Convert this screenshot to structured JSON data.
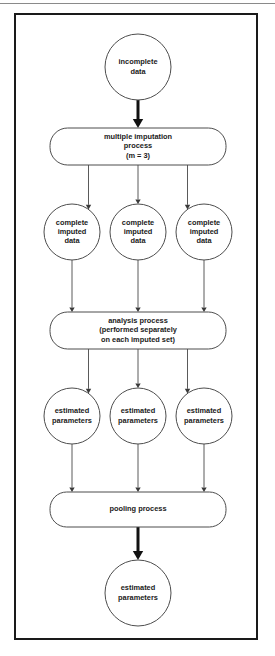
{
  "figure": {
    "frame_border_color": "#1a1a1a",
    "node_stroke_color": "#4d4d4d",
    "edge_color": "#5a5a5a",
    "emphasis_edge_color": "#111111"
  },
  "chart_data": {
    "type": "diagram",
    "title": "",
    "subtitle": "",
    "xlabel": "",
    "ylabel": "",
    "legend": [],
    "nodes": [
      {
        "id": "n1",
        "shape": "circle",
        "lines": [
          "incomplete",
          "data"
        ],
        "cx": 124,
        "cy": 54,
        "r": 33
      },
      {
        "id": "n2",
        "shape": "roundrect",
        "lines": [
          "multiple imputation",
          "process",
          "(m = 3)"
        ],
        "x": 36,
        "y": 115,
        "w": 176,
        "h": 37
      },
      {
        "id": "n3",
        "shape": "circle",
        "lines": [
          "complete",
          "imputed",
          "data"
        ],
        "cx": 58,
        "cy": 219,
        "r": 28
      },
      {
        "id": "n4",
        "shape": "circle",
        "lines": [
          "complete",
          "imputed",
          "data"
        ],
        "cx": 124,
        "cy": 219,
        "r": 28
      },
      {
        "id": "n5",
        "shape": "circle",
        "lines": [
          "complete",
          "imputed",
          "data"
        ],
        "cx": 190,
        "cy": 219,
        "r": 28
      },
      {
        "id": "n6",
        "shape": "roundrect",
        "lines": [
          "analysis process",
          "(performed separately",
          "on each imputed set)"
        ],
        "x": 36,
        "y": 299,
        "w": 176,
        "h": 37
      },
      {
        "id": "n7",
        "shape": "circle",
        "lines": [
          "estimated",
          "parameters"
        ],
        "cx": 58,
        "cy": 403,
        "r": 28
      },
      {
        "id": "n8",
        "shape": "circle",
        "lines": [
          "estimated",
          "parameters"
        ],
        "cx": 124,
        "cy": 403,
        "r": 28
      },
      {
        "id": "n9",
        "shape": "circle",
        "lines": [
          "estimated",
          "parameters"
        ],
        "cx": 190,
        "cy": 403,
        "r": 28
      },
      {
        "id": "n10",
        "shape": "roundrect",
        "lines": [
          "pooling process"
        ],
        "x": 36,
        "y": 479,
        "w": 176,
        "h": 35
      },
      {
        "id": "n11",
        "shape": "circle",
        "lines": [
          "estimated",
          "parameters"
        ],
        "cx": 124,
        "cy": 580,
        "r": 33
      }
    ],
    "edges": [
      {
        "from": "n1",
        "to": "n2",
        "weight": "thick"
      },
      {
        "from": "n2",
        "to": "n3",
        "weight": "thin"
      },
      {
        "from": "n2",
        "to": "n4",
        "weight": "thin"
      },
      {
        "from": "n2",
        "to": "n5",
        "weight": "thin"
      },
      {
        "from": "n3",
        "to": "n6",
        "weight": "thin"
      },
      {
        "from": "n4",
        "to": "n6",
        "weight": "thin"
      },
      {
        "from": "n5",
        "to": "n6",
        "weight": "thin"
      },
      {
        "from": "n6",
        "to": "n7",
        "weight": "thin"
      },
      {
        "from": "n6",
        "to": "n8",
        "weight": "thin"
      },
      {
        "from": "n6",
        "to": "n9",
        "weight": "thin"
      },
      {
        "from": "n7",
        "to": "n10",
        "weight": "thin"
      },
      {
        "from": "n8",
        "to": "n10",
        "weight": "thin"
      },
      {
        "from": "n9",
        "to": "n10",
        "weight": "thin"
      },
      {
        "from": "n10",
        "to": "n11",
        "weight": "thick"
      }
    ]
  }
}
